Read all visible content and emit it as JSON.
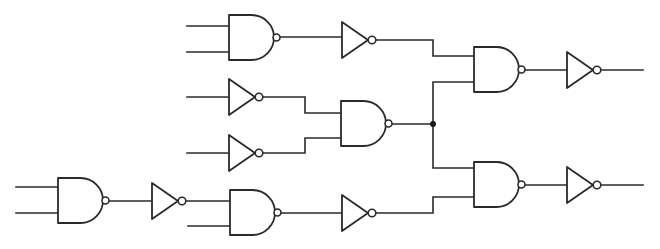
{
  "diagram": {
    "type": "logic-circuit",
    "colors": {
      "stroke": "#2a2a2a",
      "background": "#ffffff"
    },
    "gates": [
      {
        "id": "nand-1",
        "kind": "NAND",
        "x": 229,
        "y": 15,
        "w": 45,
        "h": 45,
        "inputs": [
          26,
          52
        ]
      },
      {
        "id": "not-1",
        "kind": "NOT",
        "x": 342,
        "y": 22,
        "w": 26,
        "h": 36
      },
      {
        "id": "not-2",
        "kind": "NOT",
        "x": 229,
        "y": 79,
        "w": 26,
        "h": 36
      },
      {
        "id": "not-3",
        "kind": "NOT",
        "x": 229,
        "y": 135,
        "w": 26,
        "h": 36
      },
      {
        "id": "nand-3",
        "kind": "NAND",
        "x": 341,
        "y": 101,
        "w": 45,
        "h": 45,
        "inputs": [
          113,
          138
        ]
      },
      {
        "id": "nand-4",
        "kind": "NAND",
        "x": 474,
        "y": 47,
        "w": 45,
        "h": 45,
        "inputs": [
          56,
          82
        ]
      },
      {
        "id": "not-4",
        "kind": "NOT",
        "x": 567,
        "y": 52,
        "w": 26,
        "h": 36
      },
      {
        "id": "nand-5",
        "kind": "NAND",
        "x": 58,
        "y": 178,
        "w": 45,
        "h": 45,
        "inputs": [
          187,
          213
        ]
      },
      {
        "id": "not-5",
        "kind": "NOT",
        "x": 152,
        "y": 183,
        "w": 26,
        "h": 36
      },
      {
        "id": "nand-6",
        "kind": "NAND",
        "x": 230,
        "y": 190,
        "w": 45,
        "h": 45,
        "inputs": [
          201,
          226
        ]
      },
      {
        "id": "not-6",
        "kind": "NOT",
        "x": 342,
        "y": 195,
        "w": 26,
        "h": 36
      },
      {
        "id": "nand-7",
        "kind": "NAND",
        "x": 474,
        "y": 162,
        "w": 45,
        "h": 45,
        "inputs": [
          168,
          197
        ]
      },
      {
        "id": "not-7",
        "kind": "NOT",
        "x": 567,
        "y": 167,
        "w": 26,
        "h": 36
      }
    ],
    "wires": [
      "M187,26 H229",
      "M187,52 H229",
      "M279,37 H342",
      "M373,40 H433 V56 H474",
      "M187,97 H229",
      "M187,153 H229",
      "M261,97 H305 V113 H341",
      "M261,153 H305 V138 H341",
      "M391,124 H433",
      "M433,124 V82 H474",
      "M433,124 V168 H474",
      "M524,70 H567",
      "M598,70 H643",
      "M16,187 H58",
      "M16,213 H58",
      "M108,201 H152",
      "M184,201 H230",
      "M188,226 H230",
      "M280,213 H342",
      "M374,213 H433 V197 H474",
      "M524,185 H567",
      "M598,185 H643"
    ],
    "junctions": [
      {
        "x": 433,
        "y": 124
      }
    ]
  }
}
